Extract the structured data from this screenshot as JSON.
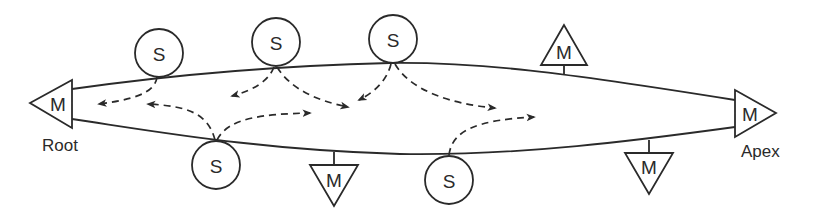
{
  "diagram": {
    "labels": {
      "root": "Root",
      "apex": "Apex"
    },
    "node_letters": {
      "sender": "S",
      "modulator": "M"
    },
    "end_nodes": [
      {
        "id": "root-m",
        "letter": "M",
        "orientation": "left",
        "caption": "Root"
      },
      {
        "id": "apex-m",
        "letter": "M",
        "orientation": "right",
        "caption": "Apex"
      }
    ],
    "s_nodes": [
      {
        "id": "s1",
        "letter": "S",
        "side": "top"
      },
      {
        "id": "s2",
        "letter": "S",
        "side": "top"
      },
      {
        "id": "s3",
        "letter": "S",
        "side": "top"
      },
      {
        "id": "s4",
        "letter": "S",
        "side": "bottom"
      },
      {
        "id": "s5",
        "letter": "S",
        "side": "bottom"
      }
    ],
    "m_nodes": [
      {
        "id": "m-top",
        "letter": "M",
        "side": "top"
      },
      {
        "id": "m-bottom-1",
        "letter": "M",
        "side": "bottom"
      },
      {
        "id": "m-bottom-2",
        "letter": "M",
        "side": "bottom"
      }
    ],
    "colors": {
      "ink": "#2a2a2a",
      "background": "#ffffff"
    }
  }
}
